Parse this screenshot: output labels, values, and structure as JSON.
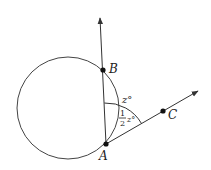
{
  "diagram": {
    "type": "geometry",
    "colors": {
      "stroke": "#333333",
      "background": "#ffffff"
    },
    "points": {
      "B": {
        "label": "B"
      },
      "A": {
        "label": "A"
      },
      "C": {
        "label": "C"
      }
    },
    "angles": {
      "outer": {
        "label": "z°"
      },
      "inner": {
        "numerator": "1",
        "denominator": "2",
        "suffix": "z°"
      }
    }
  }
}
